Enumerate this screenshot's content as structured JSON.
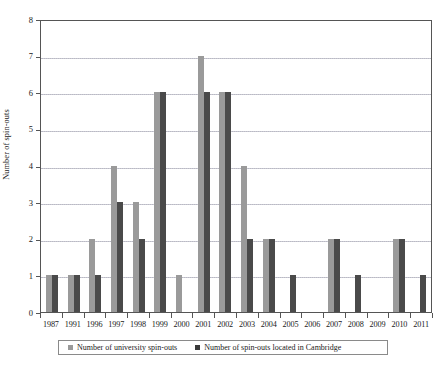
{
  "chart_data": {
    "type": "bar",
    "title": "",
    "xlabel": "",
    "ylabel": "Number of spin-outs",
    "ylim": [
      0,
      8
    ],
    "yticks": [
      0,
      1,
      2,
      3,
      4,
      5,
      6,
      7,
      8
    ],
    "grid": true,
    "legend_position": "bottom",
    "categories": [
      "1987",
      "1991",
      "1996",
      "1997",
      "1998",
      "1999",
      "2000",
      "2001",
      "2002",
      "2003",
      "2004",
      "2005",
      "2006",
      "2007",
      "2008",
      "2009",
      "2010",
      "2011"
    ],
    "series": [
      {
        "name": "Number of university spin-outs",
        "color": "#9a9a9a",
        "values": [
          1,
          1,
          2,
          4,
          3,
          6,
          1,
          7,
          6,
          4,
          2,
          0,
          0,
          2,
          0,
          0,
          2,
          0
        ]
      },
      {
        "name": "Number of spin-outs located in Cambridge",
        "color": "#4a4a4a",
        "values": [
          1,
          1,
          1,
          3,
          2,
          6,
          0,
          6,
          6,
          2,
          2,
          1,
          0,
          2,
          1,
          0,
          2,
          1
        ]
      }
    ]
  },
  "legend": {
    "items": [
      {
        "label": "Number of university spin-outs",
        "swatch": "series-1-swatch"
      },
      {
        "label": "Number of spin-outs located in Cambridge",
        "swatch": "series-2-swatch"
      }
    ]
  },
  "caption": {
    "text": ""
  }
}
